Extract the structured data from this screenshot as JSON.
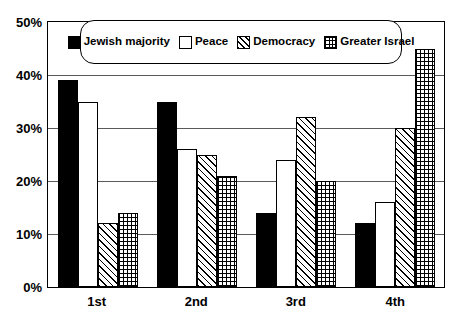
{
  "chart_data": {
    "type": "bar",
    "title": "",
    "subtitle": "",
    "xlabel": "",
    "ylabel": "",
    "categories": [
      "1st",
      "2nd",
      "3rd",
      "4th"
    ],
    "series": [
      {
        "name": "Jewish majority",
        "pattern": "solid",
        "values": [
          39,
          35,
          14,
          12
        ]
      },
      {
        "name": "Peace",
        "pattern": "empty",
        "values": [
          35,
          26,
          24,
          16
        ]
      },
      {
        "name": "Democracy",
        "pattern": "hatch",
        "values": [
          12,
          25,
          32,
          30
        ]
      },
      {
        "name": "Greater Israel",
        "pattern": "crosshatch",
        "values": [
          14,
          21,
          20,
          45
        ]
      }
    ],
    "ylim": [
      0,
      50
    ],
    "ytick_step": 10,
    "ytick_labels": [
      "0%",
      "10%",
      "20%",
      "30%",
      "40%",
      "50%"
    ],
    "ytick_values": [
      0,
      10,
      20,
      30,
      40,
      50
    ],
    "grid": true,
    "legend_position": "top-center",
    "colors": {
      "background": "#ffffff",
      "axis": "#000000",
      "gridline": "#5a5a5a",
      "bar_fill": "#000000",
      "bar_outline": "#000000"
    }
  },
  "legend": {
    "items": [
      {
        "label": "Jewish majority"
      },
      {
        "label": "Peace"
      },
      {
        "label": "Democracy"
      },
      {
        "label": "Greater Israel"
      }
    ]
  }
}
